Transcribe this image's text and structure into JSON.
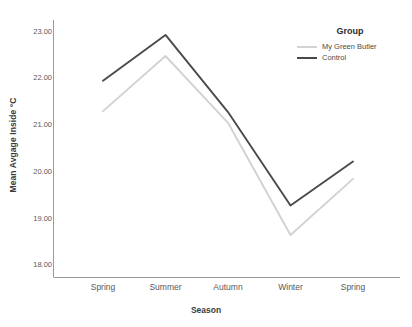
{
  "chart_data": {
    "type": "line",
    "title": "",
    "xlabel": "Season",
    "ylabel": "Mean Avgage Inside °C",
    "categories": [
      "Spring",
      "Summer",
      "Autumn",
      "Winter",
      "Spring"
    ],
    "ylim": [
      17.75,
      23.25
    ],
    "yticks": [
      "18.00",
      "19.00",
      "20.00",
      "21.00",
      "22.00",
      "23.00"
    ],
    "ytick_values": [
      18.0,
      19.0,
      20.0,
      21.0,
      22.0,
      23.0
    ],
    "grid": false,
    "legend_position": "top-right",
    "legend_title": "Group",
    "series": [
      {
        "name": "My Green Butler",
        "color": "#d2d2d2",
        "values": [
          21.3,
          22.48,
          21.05,
          18.65,
          19.85
        ]
      },
      {
        "name": "Control",
        "color": "#4a4a4a",
        "values": [
          21.95,
          22.93,
          21.28,
          19.28,
          20.22
        ]
      }
    ]
  },
  "axis": {
    "x_title": "Season",
    "y_title": "Mean Avgage Inside °C"
  },
  "legend": {
    "title": "Group",
    "items": [
      {
        "label": "My Green Butler",
        "color": "#d2d2d2"
      },
      {
        "label": "Control",
        "color": "#4a4a4a"
      }
    ]
  }
}
